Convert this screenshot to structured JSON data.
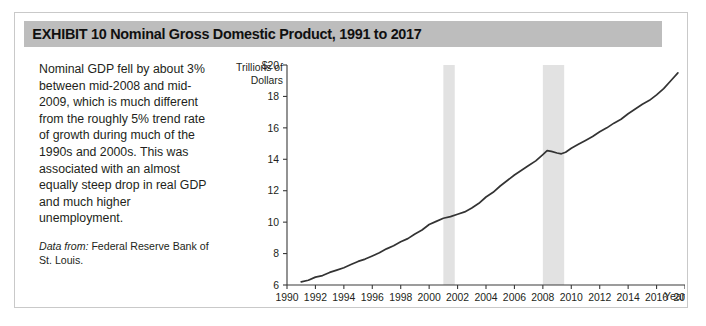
{
  "exhibit": {
    "label": "EXHIBIT 10",
    "title": "EXHIBIT 10   Nominal Gross Domestic Product, 1991 to 2017",
    "banner_color": "#bdbdbd",
    "border_color": "#c9c9c9"
  },
  "caption": {
    "body": "Nominal GDP fell by about 3% between mid-2008 and mid-2009, which is much different from the roughly 5% trend rate of growth during much of the 1990s and 2000s. This was associated with an almost equally steep drop in real GDP and much higher unemployment.",
    "source_label": "Data from:",
    "source_text": " Federal Reserve Bank of St. Louis."
  },
  "chart_data": {
    "type": "line",
    "title": "Nominal Gross Domestic Product, 1991 to 2017",
    "xlabel": "Year",
    "ylabel": "Trillions of Dollars",
    "ylabel_line1": "Trillions of",
    "ylabel_line2": "Dollars",
    "xlim": [
      1990,
      2018
    ],
    "ylim": [
      6,
      20
    ],
    "grid": false,
    "legend": "none",
    "line_color": "#333333",
    "recession_band_color": "#e2e2e2",
    "xticks": [
      1990,
      1992,
      1994,
      1996,
      1998,
      2000,
      2002,
      2004,
      2006,
      2008,
      2010,
      2012,
      2014,
      2016,
      2018
    ],
    "xtick_labels": [
      "1990",
      "1992",
      "1994",
      "1996",
      "1998",
      "2000",
      "2002",
      "2004",
      "2006",
      "2008",
      "2010",
      "2012",
      "2014",
      "2016",
      "2018"
    ],
    "yticks": [
      6,
      8,
      10,
      12,
      14,
      16,
      18,
      20
    ],
    "ytick_labels": [
      "6",
      "8",
      "10",
      "12",
      "14",
      "16",
      "18",
      "$20"
    ],
    "series": [
      {
        "name": "Nominal GDP",
        "x": [
          1991,
          1991.5,
          1992,
          1992.5,
          1993,
          1993.5,
          1994,
          1994.5,
          1995,
          1995.5,
          1996,
          1996.5,
          1997,
          1997.5,
          1998,
          1998.5,
          1999,
          1999.5,
          2000,
          2000.5,
          2001,
          2001.5,
          2002,
          2002.5,
          2003,
          2003.5,
          2004,
          2004.5,
          2005,
          2005.5,
          2006,
          2006.5,
          2007,
          2007.5,
          2008,
          2008.3,
          2008.6,
          2009,
          2009.3,
          2009.6,
          2010,
          2010.5,
          2011,
          2011.5,
          2012,
          2012.5,
          2013,
          2013.5,
          2014,
          2014.5,
          2015,
          2015.5,
          2016,
          2016.5,
          2017,
          2017.5
        ],
        "y": [
          6.2,
          6.3,
          6.5,
          6.6,
          6.8,
          6.95,
          7.1,
          7.3,
          7.5,
          7.65,
          7.85,
          8.05,
          8.3,
          8.5,
          8.75,
          8.95,
          9.25,
          9.5,
          9.85,
          10.05,
          10.25,
          10.35,
          10.5,
          10.65,
          10.9,
          11.2,
          11.6,
          11.9,
          12.3,
          12.65,
          13.0,
          13.3,
          13.6,
          13.9,
          14.3,
          14.55,
          14.5,
          14.4,
          14.35,
          14.45,
          14.7,
          14.95,
          15.2,
          15.45,
          15.75,
          16.0,
          16.3,
          16.55,
          16.9,
          17.2,
          17.5,
          17.75,
          18.1,
          18.5,
          19.0,
          19.5
        ]
      }
    ],
    "recession_bands": [
      {
        "label": "2001 recession",
        "start": 2001.0,
        "end": 2001.8
      },
      {
        "label": "2008-2009 recession",
        "start": 2008.0,
        "end": 2009.5
      }
    ]
  }
}
